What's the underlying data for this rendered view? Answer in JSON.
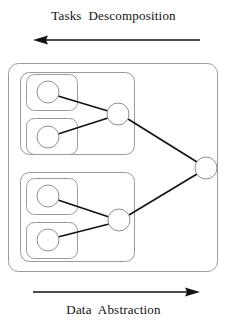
{
  "figure": {
    "top_caption": "Tasks  Descomposition",
    "bottom_caption": "Data  Abstraction",
    "colors": {
      "box_stroke": "#9b9b9b",
      "node_stroke": "#8f8f8f",
      "edge": "#111111",
      "arrow": "#111111",
      "background": "#ffffff",
      "text": "#111111"
    },
    "arrows": [
      {
        "name": "tasks-decomposition-arrow",
        "direction": "left",
        "x1": 200,
        "x2": 33,
        "y": 40
      },
      {
        "name": "data-abstraction-arrow",
        "direction": "right",
        "x1": 33,
        "x2": 200,
        "y": 292
      }
    ],
    "boxes": {
      "outer": {
        "x": 8,
        "y": 63,
        "w": 210,
        "h": 209,
        "r": 10
      },
      "groups": [
        {
          "name": "group-box-top",
          "x": 20,
          "y": 72,
          "w": 115,
          "h": 83,
          "r": 9
        },
        {
          "name": "group-box-bottom",
          "x": 20,
          "y": 172,
          "w": 115,
          "h": 90,
          "r": 9
        }
      ],
      "leaves": [
        {
          "name": "leaf-box-1",
          "x": 26,
          "y": 74,
          "w": 52,
          "h": 37,
          "r": 8
        },
        {
          "name": "leaf-box-2",
          "x": 26,
          "y": 118,
          "w": 52,
          "h": 37,
          "r": 8
        },
        {
          "name": "leaf-box-3",
          "x": 26,
          "y": 178,
          "w": 52,
          "h": 37,
          "r": 8
        },
        {
          "name": "leaf-box-4",
          "x": 26,
          "y": 222,
          "w": 52,
          "h": 37,
          "r": 8
        }
      ]
    },
    "nodes": [
      {
        "name": "leaf-node-1",
        "cx": 48,
        "cy": 92,
        "r": 11
      },
      {
        "name": "leaf-node-2",
        "cx": 48,
        "cy": 137,
        "r": 11
      },
      {
        "name": "leaf-node-3",
        "cx": 48,
        "cy": 196,
        "r": 11
      },
      {
        "name": "leaf-node-4",
        "cx": 48,
        "cy": 240,
        "r": 11
      },
      {
        "name": "intermediate-node-top",
        "cx": 118,
        "cy": 114,
        "r": 11
      },
      {
        "name": "intermediate-node-bottom",
        "cx": 119,
        "cy": 220,
        "r": 11
      },
      {
        "name": "root-node",
        "cx": 206,
        "cy": 168,
        "r": 11
      }
    ],
    "edges": [
      {
        "name": "edge-leaf1-to-top",
        "x1": 58,
        "y1": 96,
        "x2": 108,
        "y2": 111
      },
      {
        "name": "edge-leaf2-to-top",
        "x1": 58,
        "y1": 134,
        "x2": 108,
        "y2": 118
      },
      {
        "name": "edge-leaf3-to-bottom",
        "x1": 58,
        "y1": 200,
        "x2": 109,
        "y2": 217
      },
      {
        "name": "edge-leaf4-to-bottom",
        "x1": 58,
        "y1": 237,
        "x2": 109,
        "y2": 224
      },
      {
        "name": "edge-top-to-root",
        "x1": 128,
        "y1": 119,
        "x2": 197,
        "y2": 162
      },
      {
        "name": "edge-bottom-to-root",
        "x1": 129,
        "y1": 215,
        "x2": 197,
        "y2": 174
      }
    ]
  }
}
